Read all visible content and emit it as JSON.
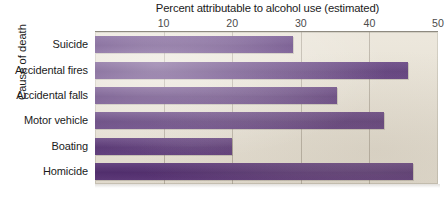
{
  "chart_data": {
    "type": "bar",
    "orientation": "horizontal",
    "title": "Percent attributable to alcohol use (estimated)",
    "xlabel": "Percent attributable to alcohol use (estimated)",
    "ylabel": "Cause of death",
    "xlim": [
      0,
      50
    ],
    "xticks": [
      10,
      20,
      30,
      40,
      50
    ],
    "xtick_labels": [
      "10",
      "20",
      "30",
      "40",
      "50"
    ],
    "grid": true,
    "legend": "none",
    "categories": [
      "Suicide",
      "Accidental fires",
      "Accidental falls",
      "Motor vehicle",
      "Boating",
      "Homicide"
    ],
    "values": [
      28.8,
      45.6,
      35.3,
      42.1,
      19.9,
      46.4
    ],
    "bar_color": "#49206e",
    "plot_background": "#e9e3d6",
    "gridline_color": "#8c8474"
  },
  "axis": {
    "title": "Percent attributable to alcohol use (estimated)",
    "y_title": "Cause of death",
    "ticks": [
      {
        "label": "10",
        "value": 10
      },
      {
        "label": "20",
        "value": 20
      },
      {
        "label": "30",
        "value": 30
      },
      {
        "label": "40",
        "value": 40
      },
      {
        "label": "50",
        "value": 50
      }
    ]
  },
  "bars": [
    {
      "label": "Suicide",
      "value": 28.8
    },
    {
      "label": "Accidental fires",
      "value": 45.6
    },
    {
      "label": "Accidental falls",
      "value": 35.3
    },
    {
      "label": "Motor vehicle",
      "value": 42.1
    },
    {
      "label": "Boating",
      "value": 19.9
    },
    {
      "label": "Homicide",
      "value": 46.4
    }
  ]
}
